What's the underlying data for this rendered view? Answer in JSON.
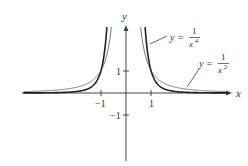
{
  "figure": {
    "axes": {
      "x_label": "x",
      "y_label": "y",
      "x_ticks": [
        {
          "value": -1,
          "label": "−1"
        },
        {
          "value": 1,
          "label": "1"
        }
      ],
      "y_ticks": [
        {
          "value": 1,
          "label": "1"
        },
        {
          "value": -1,
          "label": "−1"
        }
      ]
    },
    "curves": [
      {
        "id": "inv_x4",
        "label_lhs": "y =",
        "label_num": "1",
        "label_den_base": "x",
        "label_den_exp": "4",
        "stroke": "#222222",
        "width": 1.6
      },
      {
        "id": "inv_x2",
        "label_lhs": "y =",
        "label_num": "1",
        "label_den_base": "x",
        "label_den_exp": "2",
        "stroke": "#777777",
        "width": 1.0
      }
    ]
  },
  "chart_data": {
    "type": "line",
    "title": "",
    "xlabel": "x",
    "ylabel": "y",
    "xlim": [
      -4.2,
      4.2
    ],
    "ylim": [
      -3,
      3
    ],
    "grid": false,
    "x_ticks": [
      -1,
      1
    ],
    "y_ticks": [
      -1,
      1
    ],
    "series": [
      {
        "name": "y = 1/x^4",
        "x": [
          -4,
          -2,
          -1.5,
          -1,
          -0.9,
          -0.8,
          -0.76,
          0.76,
          0.8,
          0.9,
          1,
          1.5,
          2,
          4
        ],
        "y": [
          0.0039,
          0.0625,
          0.198,
          1,
          1.524,
          2.441,
          2.93,
          2.93,
          2.441,
          1.524,
          1,
          0.198,
          0.0625,
          0.0039
        ]
      },
      {
        "name": "y = 1/x^2",
        "x": [
          -4,
          -2,
          -1.5,
          -1,
          -0.8,
          -0.7,
          -0.584,
          0.584,
          0.7,
          0.8,
          1,
          1.5,
          2,
          4
        ],
        "y": [
          0.0625,
          0.25,
          0.444,
          1,
          1.5625,
          2.041,
          2.93,
          2.93,
          2.041,
          1.5625,
          1,
          0.444,
          0.25,
          0.0625
        ]
      }
    ],
    "annotations": [
      "y = 1/x^4",
      "y = 1/x^2"
    ]
  }
}
